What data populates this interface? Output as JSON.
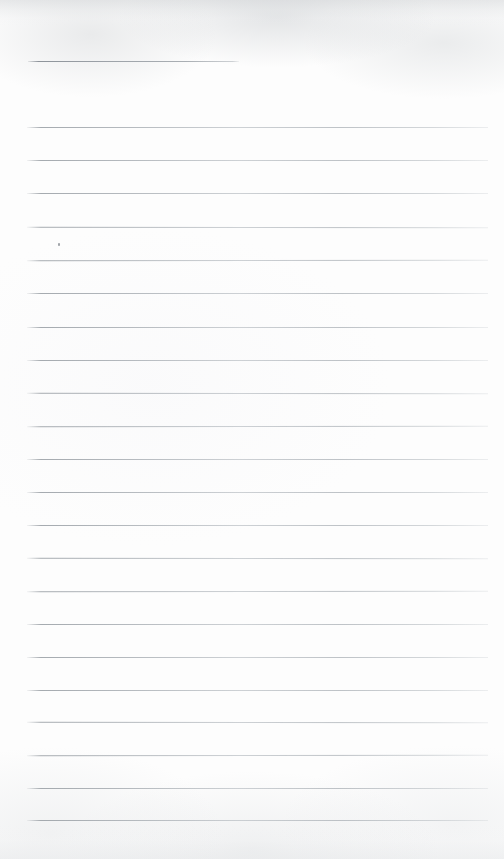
{
  "document": {
    "type": "scanned-lined-paper",
    "title": "Blank ruled notebook page",
    "width": 504,
    "height": 859,
    "text_content": "",
    "is_blank": true
  },
  "colors": {
    "paper": "#fdfdfd",
    "rule_line": "#a6acb2",
    "rule_line_faded": "#c8cdd2",
    "speck": "#787e84",
    "edge_shadow": "#c4c7ca"
  },
  "layout": {
    "left_margin_px": 27,
    "right_edge_px": 488,
    "first_line_y_px": 61,
    "body_first_line_y_px": 127,
    "line_spacing_px": 33.2,
    "short_line_right_edge_px": 239
  },
  "rules": [
    {
      "name": "title-rule",
      "y": 61,
      "x": 28,
      "width": 211,
      "short": true
    },
    {
      "name": "body-rule-1",
      "y": 127,
      "x": 27,
      "width": 461,
      "short": false
    },
    {
      "name": "body-rule-2",
      "y": 160,
      "x": 27,
      "width": 461,
      "short": false
    },
    {
      "name": "body-rule-3",
      "y": 193,
      "x": 27,
      "width": 461,
      "short": false
    },
    {
      "name": "body-rule-4",
      "y": 227,
      "x": 27,
      "width": 461,
      "short": false
    },
    {
      "name": "body-rule-5",
      "y": 260,
      "x": 27,
      "width": 461,
      "short": false
    },
    {
      "name": "body-rule-6",
      "y": 293,
      "x": 27,
      "width": 461,
      "short": false
    },
    {
      "name": "body-rule-7",
      "y": 327,
      "x": 27,
      "width": 461,
      "short": false
    },
    {
      "name": "body-rule-8",
      "y": 360,
      "x": 27,
      "width": 461,
      "short": false
    },
    {
      "name": "body-rule-9",
      "y": 393,
      "x": 27,
      "width": 461,
      "short": false
    },
    {
      "name": "body-rule-10",
      "y": 426,
      "x": 27,
      "width": 461,
      "short": false
    },
    {
      "name": "body-rule-11",
      "y": 459,
      "x": 27,
      "width": 461,
      "short": false
    },
    {
      "name": "body-rule-12",
      "y": 492,
      "x": 27,
      "width": 461,
      "short": false
    },
    {
      "name": "body-rule-13",
      "y": 525,
      "x": 27,
      "width": 461,
      "short": false
    },
    {
      "name": "body-rule-14",
      "y": 558,
      "x": 27,
      "width": 461,
      "short": false
    },
    {
      "name": "body-rule-15",
      "y": 591,
      "x": 27,
      "width": 461,
      "short": false
    },
    {
      "name": "body-rule-16",
      "y": 624,
      "x": 27,
      "width": 461,
      "short": false
    },
    {
      "name": "body-rule-17",
      "y": 657,
      "x": 27,
      "width": 461,
      "short": false
    },
    {
      "name": "body-rule-18",
      "y": 690,
      "x": 27,
      "width": 461,
      "short": false
    },
    {
      "name": "body-rule-19",
      "y": 722,
      "x": 27,
      "width": 461,
      "short": false
    },
    {
      "name": "body-rule-20",
      "y": 755,
      "x": 27,
      "width": 461,
      "short": false
    },
    {
      "name": "body-rule-21",
      "y": 788,
      "x": 27,
      "width": 461,
      "short": false
    },
    {
      "name": "body-rule-22",
      "y": 820,
      "x": 27,
      "width": 461,
      "short": false
    }
  ],
  "marks": [
    {
      "name": "paper-speck",
      "x": 58,
      "y": 243
    }
  ]
}
